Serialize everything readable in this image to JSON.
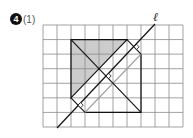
{
  "problem": {
    "number": "4",
    "part": "(1)"
  },
  "line_label": "ℓ",
  "grid": {
    "columns": 10,
    "rows": 7,
    "origin_px": [
      43,
      25
    ],
    "cell_w": 14,
    "cell_h": 14.57
  },
  "shapes": {
    "original_triangle": [
      [
        2,
        1
      ],
      [
        6,
        1
      ],
      [
        2,
        5
      ]
    ],
    "reflected_triangle": [
      [
        7,
        6
      ],
      [
        7,
        2
      ],
      [
        3,
        6
      ]
    ],
    "line_l": [
      [
        1,
        7
      ],
      [
        8,
        0
      ]
    ],
    "perpendicular_segments": [
      [
        [
          6,
          1
        ],
        [
          7,
          2
        ]
      ],
      [
        [
          2,
          5
        ],
        [
          3,
          6
        ]
      ],
      [
        [
          2,
          1
        ],
        [
          7,
          6
        ]
      ]
    ],
    "right_angle_marks": [
      [
        6.5,
        1.5
      ],
      [
        4.5,
        3.5
      ],
      [
        2.5,
        5.5
      ]
    ]
  },
  "colors": {
    "grid": "#8a8a8a",
    "stroke": "#111111",
    "shade": "#cccccc",
    "image_hypotenuse": "#9a9a9a"
  }
}
